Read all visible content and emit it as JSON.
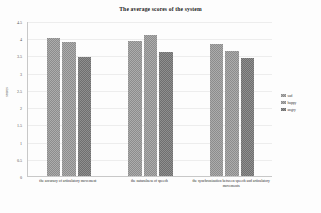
{
  "chart_data": {
    "type": "bar",
    "title": "The average scores of the system",
    "xlabel": "",
    "ylabel": "scores",
    "ylim": [
      0,
      4.5
    ],
    "ytick_step": 0.5,
    "yticks": [
      "0",
      "0.5",
      "1",
      "1.5",
      "2",
      "2.5",
      "3",
      "3.5",
      "4",
      "4.5"
    ],
    "grid": true,
    "legend_position": "right",
    "categories": [
      "the accuracy of articulatory movement",
      "the naturalness of speech",
      "the synchronization between speech and articulatory movements"
    ],
    "series": [
      {
        "name": "sad",
        "values": [
          4.0,
          3.93,
          3.82
        ]
      },
      {
        "name": "happy",
        "values": [
          3.9,
          4.08,
          3.62
        ]
      },
      {
        "name": "angry",
        "values": [
          3.45,
          3.6,
          3.43
        ]
      }
    ],
    "colors": {
      "sad": "#8c8c8c",
      "happy": "#8c8c8c",
      "angry": "#6f6f6f",
      "gridline": "#ededed",
      "axis": "#c8c8c8",
      "background": "#fdfdfd"
    }
  }
}
